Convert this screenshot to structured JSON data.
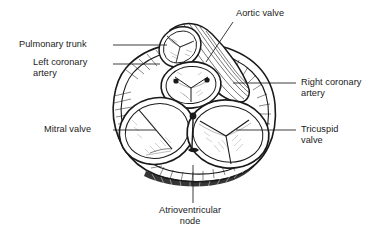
{
  "figure": {
    "ink_color": "#1a1a1a",
    "background_color": "#ffffff",
    "leader_line_color": "#1a1a1a"
  },
  "labels": [
    {
      "id": "pulmonary-trunk",
      "text": "Pulmonary trunk",
      "lines": [
        "Pulmonary trunk"
      ],
      "side": "left",
      "leader": "horizontal"
    },
    {
      "id": "left-coronary-artery",
      "text": "Left coronary artery",
      "lines": [
        "Left coronary",
        "artery"
      ],
      "side": "left",
      "leader": "horizontal"
    },
    {
      "id": "mitral-valve",
      "text": "Mitral valve",
      "lines": [
        "Mitral valve"
      ],
      "side": "left",
      "leader": "horizontal"
    },
    {
      "id": "aortic-valve",
      "text": "Aortic valve",
      "lines": [
        "Aortic valve"
      ],
      "side": "top",
      "leader": "diagonal"
    },
    {
      "id": "right-coronary-artery",
      "text": "Right coronary artery",
      "lines": [
        "Right coronary",
        "artery"
      ],
      "side": "right",
      "leader": "horizontal"
    },
    {
      "id": "tricuspid-valve",
      "text": "Tricuspid valve",
      "lines": [
        "Tricuspid",
        "valve"
      ],
      "side": "right",
      "leader": "horizontal"
    },
    {
      "id": "atrioventricular-node",
      "text": "Atrioventricular node",
      "lines": [
        "Atrioventricular",
        "node"
      ],
      "side": "bottom",
      "leader": "vertical"
    }
  ],
  "structures": [
    {
      "id": "pulmonary-trunk-vessel",
      "name": "Pulmonary trunk",
      "cusps": 3
    },
    {
      "id": "aortic-valve-opening",
      "name": "Aortic valve",
      "cusps": 3
    },
    {
      "id": "mitral-valve-opening",
      "name": "Mitral valve",
      "cusps": 2
    },
    {
      "id": "tricuspid-valve-opening",
      "name": "Tricuspid valve",
      "cusps": 3
    },
    {
      "id": "left-coronary-ostium",
      "name": "Left coronary artery ostium",
      "cusps": 0
    },
    {
      "id": "right-coronary-ostium",
      "name": "Right coronary artery ostium",
      "cusps": 0
    },
    {
      "id": "av-node-marker",
      "name": "Atrioventricular node",
      "cusps": 0
    },
    {
      "id": "fibrous-skeleton",
      "name": "Fibrous skeleton of heart",
      "cusps": 0
    }
  ]
}
